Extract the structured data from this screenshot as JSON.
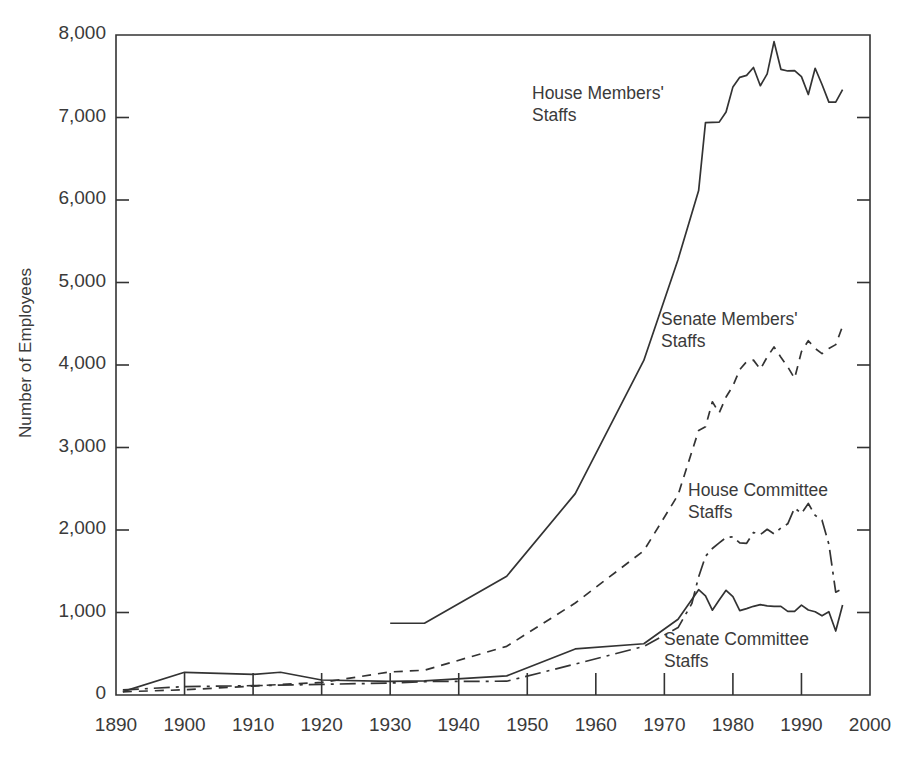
{
  "chart_data": {
    "type": "line",
    "title": "",
    "xlabel": "",
    "ylabel": "Number of Employees",
    "xlim": [
      1890,
      2000
    ],
    "ylim": [
      0,
      8000
    ],
    "xticks": [
      1890,
      1900,
      1910,
      1920,
      1930,
      1940,
      1950,
      1960,
      1970,
      1980,
      1990,
      2000
    ],
    "xtick_labels": [
      "1890",
      "1900",
      "1910",
      "1920",
      "1930",
      "1940",
      "1950",
      "1960",
      "1970",
      "1980",
      "1990",
      "2000"
    ],
    "yticks": [
      0,
      1000,
      2000,
      3000,
      4000,
      5000,
      6000,
      7000,
      8000
    ],
    "ytick_labels": [
      "0",
      "1,000",
      "2,000",
      "3,000",
      "4,000",
      "5,000",
      "6,000",
      "7,000",
      "8,000"
    ],
    "grid": false,
    "legend_position": "inline-annotations",
    "line_color": "#333333",
    "series": [
      {
        "name": "House Members' Staffs",
        "label_lines": "House Members'\nStaffs",
        "style": "solid",
        "x": [
          1930,
          1935,
          1947,
          1957,
          1967,
          1972,
          1975,
          1976,
          1977,
          1978,
          1979,
          1980,
          1981,
          1982,
          1983,
          1984,
          1985,
          1986,
          1987,
          1988,
          1989,
          1990,
          1991,
          1992,
          1993,
          1994,
          1995,
          1996
        ],
        "values": [
          870,
          870,
          1440,
          2441,
          4055,
          5280,
          6114,
          6939,
          6942,
          6944,
          7067,
          7371,
          7487,
          7511,
          7606,
          7385,
          7528,
          7920,
          7584,
          7564,
          7569,
          7496,
          7278,
          7597,
          7400,
          7186,
          7186,
          7337
        ]
      },
      {
        "name": "Senate Members' Staffs",
        "label_lines": "Senate Members'\nStaffs",
        "style": "dashed",
        "x": [
          1891,
          1900,
          1910,
          1914,
          1920,
          1930,
          1935,
          1947,
          1957,
          1967,
          1972,
          1975,
          1976,
          1977,
          1978,
          1979,
          1980,
          1981,
          1982,
          1983,
          1984,
          1985,
          1986,
          1987,
          1988,
          1989,
          1990,
          1991,
          1992,
          1993,
          1994,
          1995,
          1996
        ],
        "values": [
          39,
          63,
          108,
          128,
          152,
          280,
          300,
          590,
          1115,
          1749,
          2426,
          3207,
          3251,
          3554,
          3420,
          3612,
          3746,
          3945,
          4041,
          4059,
          3949,
          4097,
          4219,
          4095,
          3977,
          3837,
          4162,
          4294,
          4200,
          4138,
          4200,
          4247,
          4470
        ]
      },
      {
        "name": "House Committee Staffs",
        "label_lines": "House Committee\nStaffs",
        "style": "dashdot",
        "x": [
          1891,
          1900,
          1910,
          1920,
          1930,
          1935,
          1947,
          1957,
          1967,
          1972,
          1974,
          1975,
          1976,
          1977,
          1978,
          1979,
          1980,
          1981,
          1982,
          1983,
          1984,
          1985,
          1986,
          1987,
          1988,
          1989,
          1990,
          1991,
          1992,
          1993,
          1994,
          1995,
          1996
        ],
        "values": [
          62,
          101,
          113,
          129,
          145,
          163,
          167,
          375,
          589,
          817,
          1107,
          1433,
          1680,
          1776,
          1844,
          1909,
          1917,
          1843,
          1839,
          1970,
          1944,
          2009,
          1954,
          2024,
          2075,
          2267,
          2201,
          2321,
          2178,
          2118,
          1828,
          1246,
          1290
        ]
      },
      {
        "name": "Senate Committee Staffs",
        "label_lines": "Senate Committee\nStaffs",
        "style": "solid",
        "x": [
          1891,
          1900,
          1910,
          1914,
          1920,
          1930,
          1935,
          1947,
          1957,
          1967,
          1972,
          1975,
          1976,
          1977,
          1978,
          1979,
          1980,
          1981,
          1982,
          1983,
          1984,
          1985,
          1986,
          1987,
          1988,
          1989,
          1990,
          1991,
          1992,
          1993,
          1994,
          1995,
          1996
        ],
        "values": [
          41,
          275,
          250,
          276,
          182,
          165,
          172,
          232,
          558,
          621,
          918,
          1277,
          1201,
          1028,
          1151,
          1269,
          1191,
          1022,
          1047,
          1075,
          1095,
          1080,
          1075,
          1074,
          1013,
          1013,
          1090,
          1030,
          1009,
          960,
          1009,
          775,
          1090
        ]
      }
    ],
    "annotations": [
      {
        "text": "House Members'\nStaffs",
        "x_px": 532,
        "y_px": 82
      },
      {
        "text": "Senate Members'\nStaffs",
        "x_px": 661,
        "y_px": 308
      },
      {
        "text": "House Committee\nStaffs",
        "x_px": 688,
        "y_px": 479
      },
      {
        "text": "Senate Committee\nStaffs",
        "x_px": 664,
        "y_px": 628
      }
    ]
  }
}
